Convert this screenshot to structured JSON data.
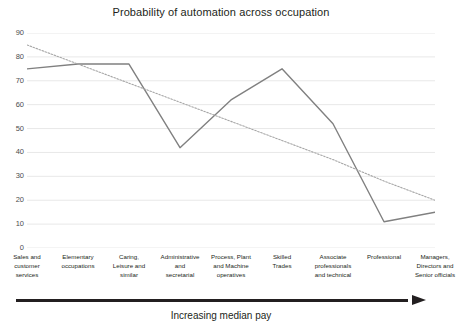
{
  "chart_data": {
    "type": "line",
    "title": "Probability of automation across occupation",
    "xlabel": "Increasing median pay",
    "ylabel": "",
    "ylim": [
      0,
      90
    ],
    "ytick_step": 10,
    "yticks": [
      0,
      10,
      20,
      30,
      40,
      50,
      60,
      70,
      80,
      90
    ],
    "grid": true,
    "grid_axis": "y",
    "legend": "none",
    "categories": [
      "Sales and customer services",
      "Elementary occupations",
      "Caring, Leisure and similar",
      "Administrative and secretarial",
      "Process, Plant and Machine operatives",
      "Skilled Trades",
      "Associate professionals and technical",
      "Professional",
      "Managers, Directors and Senior officials"
    ],
    "category_lines": [
      [
        "Sales and",
        "customer",
        "services"
      ],
      [
        "Elementary",
        "occupations"
      ],
      [
        "Caring,",
        "Leisure and",
        "similar"
      ],
      [
        "Administrative",
        "and",
        "secretarial"
      ],
      [
        "Process, Plant",
        "and Machine",
        "operatives"
      ],
      [
        "Skilled",
        "Trades"
      ],
      [
        "Associate",
        "professionals",
        "and technical"
      ],
      [
        "Professional"
      ],
      [
        "Managers,",
        "Directors and",
        "Senior officials"
      ]
    ],
    "series": [
      {
        "name": "Probability of automation",
        "style": "solid",
        "color": "#808080",
        "values": [
          75,
          77,
          77,
          42,
          62,
          75,
          52,
          11,
          15
        ]
      },
      {
        "name": "Linear trend",
        "style": "dotted",
        "color": "#a6a6a6",
        "values": [
          85,
          77,
          69,
          61,
          53,
          45,
          37,
          28,
          20
        ]
      }
    ]
  },
  "axis_caption": {
    "text": "Increasing median pay",
    "arrow_icon": "right-arrow-icon"
  },
  "colors": {
    "background": "#ffffff",
    "text": "#231f20",
    "grid": "#e8e8e8",
    "series_line": "#808080",
    "trend_line": "#a6a6a6",
    "arrow": "#231f20"
  }
}
